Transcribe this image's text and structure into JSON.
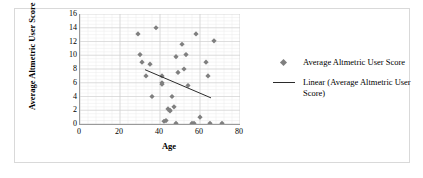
{
  "chart_data": {
    "type": "scatter",
    "title": "",
    "xlabel": "Age",
    "ylabel": "Average Altmetric User Score",
    "xlim": [
      0,
      80
    ],
    "ylim": [
      0,
      16
    ],
    "xticks": [
      0,
      20,
      40,
      60,
      80
    ],
    "yticks": [
      0,
      2,
      4,
      6,
      8,
      10,
      12,
      14,
      16
    ],
    "grid": true,
    "grid_minor": true,
    "legend_position": "right",
    "series": [
      {
        "name": "Average Altmetric User Score",
        "type": "scatter",
        "marker": "diamond",
        "color": "#7f7f7f",
        "points": [
          [
            29,
            13.1
          ],
          [
            30,
            10.1
          ],
          [
            31,
            9.0
          ],
          [
            33,
            7.0
          ],
          [
            35,
            8.7
          ],
          [
            36,
            4.0
          ],
          [
            38,
            14.0
          ],
          [
            41,
            7.0
          ],
          [
            41,
            6.0
          ],
          [
            41,
            5.8
          ],
          [
            42,
            0.4
          ],
          [
            43,
            0.5
          ],
          [
            44,
            2.2
          ],
          [
            45,
            2.0
          ],
          [
            45,
            1.9
          ],
          [
            46,
            4.0
          ],
          [
            47,
            2.5
          ],
          [
            48,
            9.8
          ],
          [
            48,
            0.1
          ],
          [
            49,
            7.5
          ],
          [
            51,
            11.6
          ],
          [
            52,
            8.0
          ],
          [
            53,
            10.1
          ],
          [
            54,
            5.6
          ],
          [
            56,
            0.1
          ],
          [
            57,
            0.1
          ],
          [
            58,
            13.1
          ],
          [
            60,
            1.0
          ],
          [
            63,
            9.0
          ],
          [
            64,
            7.0
          ],
          [
            65,
            0.1
          ],
          [
            67,
            12.1
          ],
          [
            71,
            0.1
          ]
        ]
      },
      {
        "name": "Linear (Average Altmetric User Score)",
        "type": "line",
        "color": "#2b2b2b",
        "endpoints": [
          [
            32.5,
            7.9
          ],
          [
            65.5,
            3.8
          ]
        ]
      }
    ]
  },
  "legend": {
    "entries": [
      {
        "label": "Average Altmetric User Score",
        "marker": "diamond"
      },
      {
        "label": "Linear (Average Altmetric User Score)",
        "marker": "line"
      }
    ]
  },
  "axes": {
    "x_title": "Age",
    "y_title": "Average Altmetric User Score",
    "x_tick_labels": [
      "0",
      "20",
      "40",
      "60",
      "80"
    ],
    "y_tick_labels": [
      "0",
      "2",
      "4",
      "6",
      "8",
      "10",
      "12",
      "14",
      "16"
    ]
  },
  "colors": {
    "marker": "#7f7f7f",
    "trendline": "#2b2b2b",
    "axis": "#9a9a9a",
    "gridline_major": "#cfcfcf",
    "gridline_minor": "#ebebeb",
    "frame": "#d9d9d9",
    "background": "#ffffff"
  }
}
